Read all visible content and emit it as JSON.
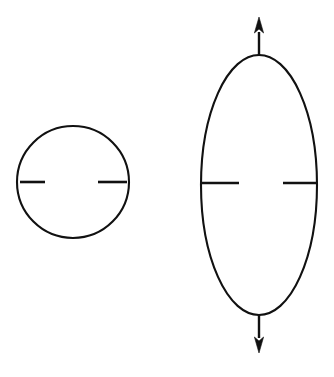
{
  "figure": {
    "title": "Cell deformation diagram: undeformed sphere and axially stretched ellipsoid",
    "background_color": "#ffffff",
    "stroke_color": "#111111",
    "canvas": {
      "width": 334,
      "height": 377
    },
    "shapes": [
      {
        "id": "left-circle",
        "name": "undeformed-circle",
        "type": "circle",
        "cx": 73,
        "cy": 182,
        "r": 56,
        "stroke_width": 2.1
      },
      {
        "id": "right-ellipse",
        "name": "deformed-ellipse",
        "type": "ellipse",
        "cx": 259,
        "cy": 185,
        "rx": 58,
        "ry": 130,
        "stroke_width": 2.1
      }
    ],
    "ticks": [
      {
        "id": "circle-tick-left",
        "name": "circle-left-tick",
        "x1": 20,
        "y1": 182,
        "x2": 45,
        "y2": 182
      },
      {
        "id": "circle-tick-right",
        "name": "circle-right-tick",
        "x1": 98,
        "y1": 182,
        "x2": 127,
        "y2": 182
      },
      {
        "id": "ellipse-tick-left",
        "name": "ellipse-left-tick",
        "x1": 202,
        "y1": 183,
        "x2": 239,
        "y2": 183
      },
      {
        "id": "ellipse-tick-right",
        "name": "ellipse-right-tick",
        "x1": 283,
        "y1": 183,
        "x2": 317,
        "y2": 183
      }
    ],
    "arrows": [
      {
        "id": "arrow-up",
        "name": "tension-arrow-up",
        "direction": "up",
        "x": 259,
        "shaft_from_y": 56,
        "shaft_to_y": 32,
        "tip_y": 17,
        "head_half_width": 4.6,
        "head_length": 16
      },
      {
        "id": "arrow-down",
        "name": "tension-arrow-down",
        "direction": "down",
        "x": 259,
        "shaft_from_y": 315,
        "shaft_to_y": 338,
        "tip_y": 353,
        "head_half_width": 4.6,
        "head_length": 16
      }
    ]
  }
}
